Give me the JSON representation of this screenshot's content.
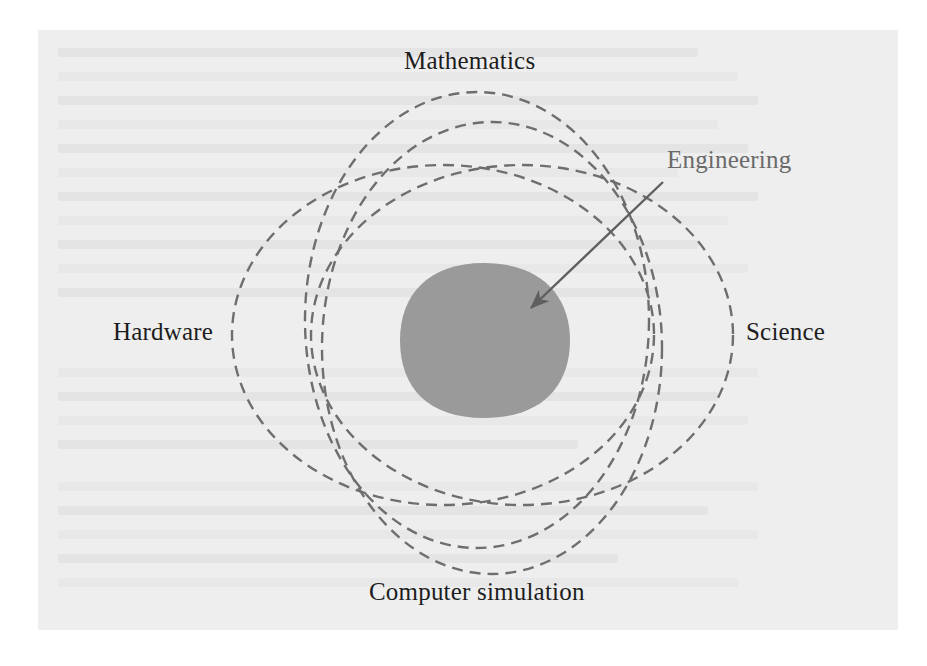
{
  "figure": {
    "kind": "venn-diagram",
    "title_visible": false,
    "background_color": "#eeeeee",
    "page_color": "#ffffff",
    "dash_stroke_color": "#6e6e6e",
    "fill_color": "#9a9a9a",
    "label_color": "#1d1d1d",
    "callout_color": "#6a6a6a"
  },
  "labels": {
    "top": "Mathematics",
    "left": "Hardware",
    "right": "Science",
    "bottom": "Computer simulation",
    "callout": "Engineering"
  },
  "sets": [
    {
      "name": "Mathematics",
      "label": "Mathematics",
      "position": "top"
    },
    {
      "name": "Hardware",
      "label": "Hardware",
      "position": "left"
    },
    {
      "name": "Science",
      "label": "Science",
      "position": "right"
    },
    {
      "name": "Computer simulation",
      "label": "Computer simulation",
      "position": "bottom"
    }
  ],
  "intersection": {
    "label": "Engineering",
    "description": "shaded central region common to all four sets",
    "shaded": true
  },
  "callout": {
    "label": "Engineering",
    "points_to": "intersection",
    "arrow": "straight-line-with-arrowhead"
  }
}
